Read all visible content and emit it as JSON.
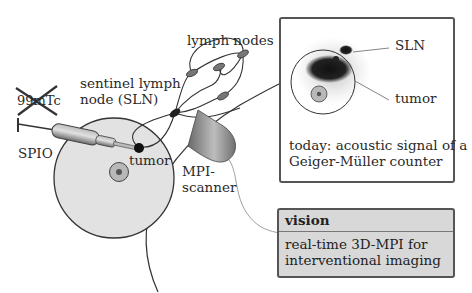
{
  "diagram": {
    "labels": {
      "isotope": "99mTc",
      "isotope_struck": true,
      "spio": "SPIO",
      "sentinel_line1": "sentinel lymph",
      "sentinel_line2": "node (SLN)",
      "lymph_nodes": "lymph nodes",
      "tumor_body": "tumor",
      "scanner_line1": "MPI-",
      "scanner_line2": "scanner"
    },
    "today_panel": {
      "sln_label": "SLN",
      "tumor_label": "tumor",
      "caption_line1": "today: acoustic signal of a",
      "caption_line2": "Geiger-Müller counter"
    },
    "vision_panel": {
      "title": "vision",
      "text_line1": "real-time 3D-MPI for",
      "text_line2": "interventional imaging"
    },
    "colors": {
      "body_fill": "#e2e2e2",
      "tumor_ring": "#b8b8b8",
      "tumor_core": "#555555",
      "node_fill": "#777777",
      "vision_bg": "#d8d8d8",
      "outline": "#333333"
    }
  }
}
